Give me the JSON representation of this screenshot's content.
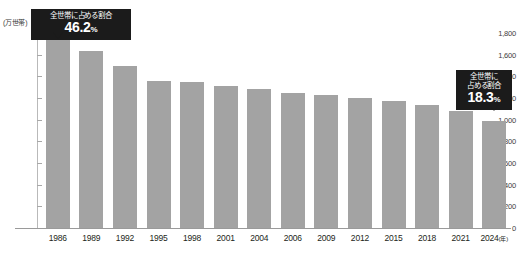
{
  "chart_data": {
    "type": "bar",
    "title": "",
    "xlabel": "年",
    "ylabel": "万世帯",
    "unit_label": "(万世帯)",
    "x_axis_suffix": "(年)",
    "categories": [
      "1986",
      "1989",
      "1992",
      "1995",
      "1998",
      "2001",
      "2004",
      "2006",
      "2009",
      "2012",
      "2015",
      "2018",
      "2021",
      "2024"
    ],
    "values": [
      1740,
      1630,
      1500,
      1360,
      1350,
      1310,
      1280,
      1250,
      1230,
      1200,
      1170,
      1140,
      1080,
      990
    ],
    "ylim": [
      0,
      1800
    ],
    "yticks": [
      0,
      200,
      400,
      600,
      800,
      1000,
      1200,
      1400,
      1600,
      1800
    ],
    "ytick_labels": [
      "0",
      "200",
      "400",
      "600",
      "800",
      "1,000",
      "1,200",
      "1,400",
      "1,600",
      "1,800"
    ],
    "grid": false,
    "legend": "none",
    "bar_color": "#a3a3a3",
    "annotations": [
      {
        "target_category": "1986",
        "title": "全世帯に占める割合",
        "value": "46.2",
        "percent_sign": "%"
      },
      {
        "target_category": "2024",
        "title_line1": "全世帯に",
        "title_line2": "占める割合",
        "value": "18.3",
        "percent_sign": "%"
      }
    ]
  },
  "colors": {
    "bar": "#a3a3a3",
    "callout_bg": "#1b1b1b",
    "callout_text": "#ffffff",
    "axis": "#9a9a9a",
    "text": "#231f20"
  }
}
